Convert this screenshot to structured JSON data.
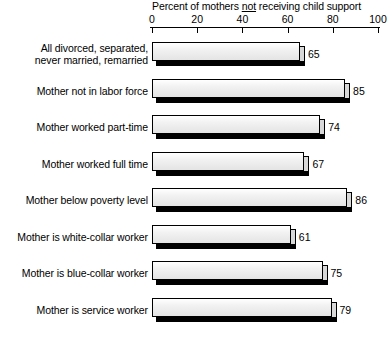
{
  "chart_data": {
    "type": "bar",
    "orientation": "horizontal",
    "title_prefix": "Percent of mothers ",
    "title_emphasis": "not",
    "title_suffix": " receiving child support",
    "title": "Percent of mothers not receiving child support",
    "xlabel": "",
    "ylabel": "",
    "xlim": [
      0,
      100
    ],
    "xticks": [
      0,
      20,
      40,
      60,
      80,
      100
    ],
    "xtick_labels": [
      "0",
      "20",
      "40",
      "60",
      "80",
      "100"
    ],
    "grid": false,
    "legend": "none",
    "categories": [
      "All divorced, separated,\nnever married, remarried",
      "Mother not in labor force",
      "Mother worked part-time",
      "Mother worked full time",
      "Mother below poverty level",
      "Mother is white-collar worker",
      "Mother is blue-collar worker",
      "Mother is service worker"
    ],
    "values": [
      65,
      85,
      74,
      67,
      86,
      61,
      75,
      79
    ],
    "value_labels": [
      "65",
      "85",
      "74",
      "67",
      "86",
      "61",
      "75",
      "79"
    ],
    "colors": {
      "bar_face_light": "#ffffff",
      "bar_face_dark": "#e4e4e4",
      "bar_outline": "#000000",
      "bar_shadow": "#000000",
      "axis": "#000000",
      "text": "#000000",
      "background": "#ffffff"
    }
  }
}
